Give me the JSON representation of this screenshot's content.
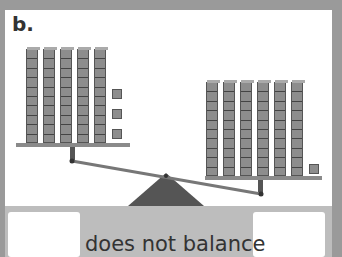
{
  "problem_label": "b.",
  "left_pan": {
    "tens_rods": 5,
    "unit_cubes": 3,
    "total": 53
  },
  "right_pan": {
    "tens_rods": 6,
    "unit_cubes": 1,
    "total": 61
  },
  "status_text": "does not balance",
  "answer_boxes": {
    "left": "",
    "right": ""
  },
  "colors": {
    "background": "#9a9a9a",
    "card": "#ffffff",
    "block": "#8d8d8d",
    "fulcrum": "#555555"
  }
}
